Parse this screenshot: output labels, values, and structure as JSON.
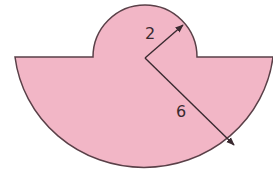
{
  "figure": {
    "fill_color": "#f2b6c6",
    "stroke_color": "#5a4048",
    "small_radius_label": "2",
    "large_radius_label": "6"
  }
}
